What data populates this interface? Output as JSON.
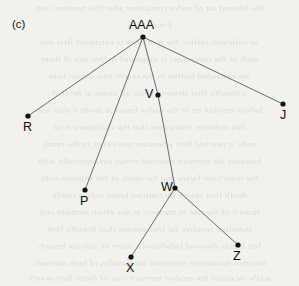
{
  "figure": {
    "panel_label": "(c)",
    "background_color": "#f2f1ee",
    "ink_color": "#121212",
    "edge_color": "#5a5a5a"
  },
  "chart_data": {
    "type": "diagram",
    "diagram_kind": "tree",
    "title": "(c)",
    "xlabel": "",
    "ylabel": "",
    "grid": false,
    "legend": null,
    "axis_ranges": {
      "x": [
        0,
        299
      ],
      "y": [
        0,
        286
      ]
    },
    "nodes": [
      {
        "id": "AAA",
        "label": "AAA",
        "x": 143,
        "y": 37,
        "label_x": 129,
        "label_y": 19,
        "label_pos": "above"
      },
      {
        "id": "R",
        "label": "R",
        "x": 28,
        "y": 116,
        "label_x": 23,
        "label_y": 121,
        "label_pos": "below"
      },
      {
        "id": "J",
        "label": "J",
        "x": 283,
        "y": 104,
        "label_x": 280,
        "label_y": 109,
        "label_pos": "below"
      },
      {
        "id": "V",
        "label": "V",
        "x": 158,
        "y": 95,
        "label_x": 145,
        "label_y": 88,
        "label_pos": "left"
      },
      {
        "id": "P",
        "label": "P",
        "x": 85,
        "y": 190,
        "label_x": 80,
        "label_y": 195,
        "label_pos": "below"
      },
      {
        "id": "W",
        "label": "W",
        "x": 175,
        "y": 188,
        "label_x": 161,
        "label_y": 181,
        "label_pos": "left"
      },
      {
        "id": "X",
        "label": "X",
        "x": 131,
        "y": 257,
        "label_x": 126,
        "label_y": 262,
        "label_pos": "below"
      },
      {
        "id": "Z",
        "label": "Z",
        "x": 238,
        "y": 245,
        "label_x": 233,
        "label_y": 250,
        "label_pos": "below"
      }
    ],
    "edges": [
      {
        "from": "AAA",
        "to": "R"
      },
      {
        "from": "AAA",
        "to": "P"
      },
      {
        "from": "AAA",
        "to": "V"
      },
      {
        "from": "AAA",
        "to": "J"
      },
      {
        "from": "V",
        "to": "W"
      },
      {
        "from": "W",
        "to": "X"
      },
      {
        "from": "W",
        "to": "Z"
      }
    ]
  },
  "bleed_text": {
    "lines": [
      {
        "y": 4,
        "text": "the filtered set of nodes remaining after this pruning step"
      },
      {
        "y": 21,
        "text": "Figure 7.12"
      },
      {
        "y": 38,
        "text": "as indicated earlier, the root node is expanded first and"
      },
      {
        "y": 55,
        "text": "each of the successors is generated before any of them"
      },
      {
        "y": 72,
        "text": "are expanded further in the search tree shown here"
      },
      {
        "y": 89,
        "text": "a breadth first strategy visits all nodes at depth d"
      },
      {
        "y": 106,
        "text": "before moving on to the nodes found at depth d plus one"
      },
      {
        "y": 123,
        "text": "this ordering guarantees that the shallowest goal"
      },
      {
        "y": 140,
        "text": "node is reached first whenever one exists in the graph"
      },
      {
        "y": 157,
        "text": "however the memory required grows exponentially with"
      },
      {
        "y": 174,
        "text": "the branching factor and the depth of the solution path"
      },
      {
        "y": 191,
        "text": "depth first search by contrast keeps only a single"
      },
      {
        "y": 208,
        "text": "branch of the tree in memory at any given moment and"
      },
      {
        "y": 225,
        "text": "therefore requires far less storage than breadth first"
      },
      {
        "y": 242,
        "text": "but it may descend indefinitely along an infinite branch"
      },
      {
        "y": 259,
        "text": "iterative deepening combines the benefits of both methods"
      },
      {
        "y": 274,
        "text": "while retaining the modest memory cost of depth first search"
      }
    ]
  }
}
